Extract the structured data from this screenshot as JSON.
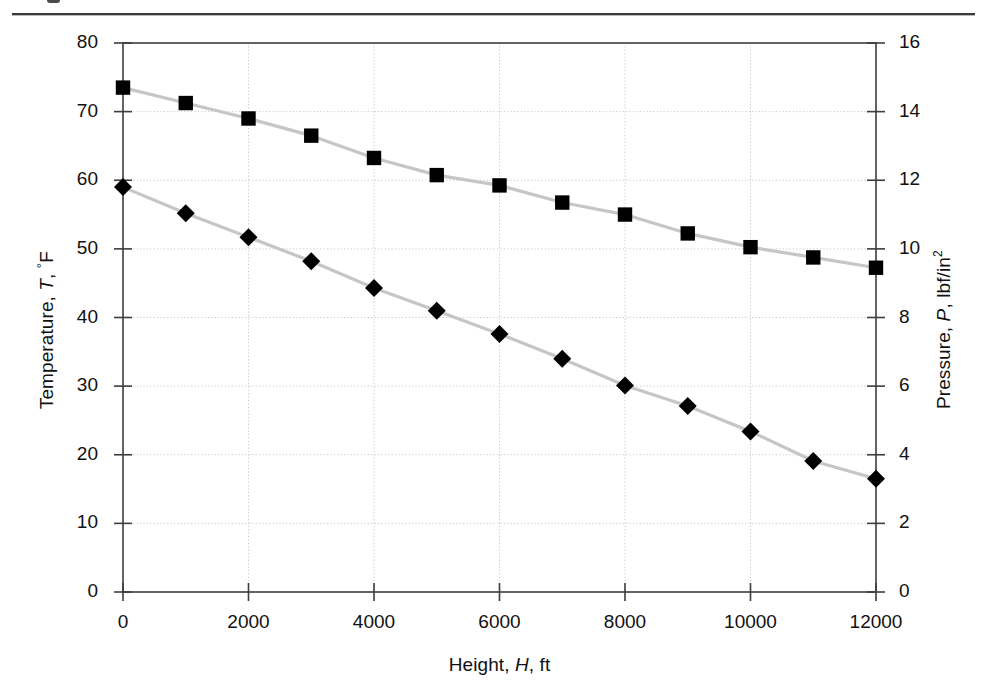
{
  "figure": {
    "has_top_rule": true
  },
  "chart_data": {
    "type": "line",
    "title": "",
    "xlabel": "Height, H, ft",
    "xlabel_parts": {
      "prefix": "Height, ",
      "symbol": "H",
      "suffix": ", ft"
    },
    "ylabel": "Temperature, T, °F",
    "ylabel_parts": {
      "prefix": "Temperature, ",
      "symbol": "T",
      "suffix": ", °F"
    },
    "y2label": "Pressure, P, lbf/in²",
    "y2label_parts": {
      "prefix": "Pressure, ",
      "symbol": "P",
      "suffix": ", lbf/in",
      "sup": "2"
    },
    "xlim": [
      0,
      12000
    ],
    "ylim": [
      0,
      80
    ],
    "y2lim": [
      0,
      16
    ],
    "xticks": [
      0,
      2000,
      4000,
      6000,
      8000,
      10000,
      12000
    ],
    "xtick_labels": [
      "0",
      "2000",
      "4000",
      "6000",
      "8000",
      "10000",
      "12000"
    ],
    "yticks": [
      0,
      10,
      20,
      30,
      40,
      50,
      60,
      70,
      80
    ],
    "ytick_labels": [
      "0",
      "10",
      "20",
      "30",
      "40",
      "50",
      "60",
      "70",
      "80"
    ],
    "y2ticks": [
      0,
      2,
      4,
      6,
      8,
      10,
      12,
      14,
      16
    ],
    "y2tick_labels": [
      "0",
      "2",
      "4",
      "6",
      "8",
      "10",
      "12",
      "14",
      "16"
    ],
    "grid": true,
    "grid_style": "dotted",
    "grid_color": "#c9c9c9",
    "legend": "none",
    "line_color": "#c6c6c6",
    "marker_color": "#000000",
    "x": [
      0,
      1000,
      2000,
      3000,
      4000,
      5000,
      6000,
      7000,
      8000,
      9000,
      10000,
      11000,
      12000
    ],
    "series": [
      {
        "name": "Temperature",
        "axis": "left",
        "marker": "diamond",
        "unit": "°F",
        "values": [
          59.0,
          55.2,
          51.7,
          48.2,
          44.3,
          41.0,
          37.6,
          34.0,
          30.1,
          27.1,
          23.4,
          19.1,
          16.5
        ]
      },
      {
        "name": "Pressure",
        "axis": "right",
        "marker": "square",
        "unit": "lbf/in2",
        "values": [
          14.7,
          14.25,
          13.8,
          13.3,
          12.65,
          12.15,
          11.85,
          11.35,
          11.0,
          10.45,
          10.05,
          9.75,
          9.45
        ]
      }
    ]
  }
}
